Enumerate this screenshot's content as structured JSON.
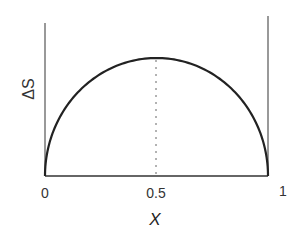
{
  "chart_data": {
    "type": "line",
    "title": "",
    "xlabel": "X",
    "ylabel": "ΔS",
    "xlim": [
      0,
      1
    ],
    "x_ticks": [
      "0",
      "0.5",
      "1"
    ],
    "y_ticks": [],
    "grid": false,
    "series": [
      {
        "name": "ΔS(X)",
        "shape": "semi-ellipse",
        "x": [
          0,
          0.05,
          0.1,
          0.2,
          0.3,
          0.4,
          0.5,
          0.6,
          0.7,
          0.8,
          0.9,
          0.95,
          1
        ],
        "values": [
          0,
          0.44,
          0.6,
          0.8,
          0.92,
          0.98,
          1.0,
          0.98,
          0.92,
          0.8,
          0.6,
          0.44,
          0
        ]
      }
    ],
    "annotations": [
      {
        "type": "dotted-vertical-line",
        "x": 0.5,
        "from": 0,
        "to": 1.0,
        "label": "maximum at X = 0.5"
      }
    ]
  },
  "labels": {
    "tick_0": "0",
    "tick_half": "0.5",
    "tick_1": "1",
    "xlabel": "X",
    "ylabel": "ΔS"
  },
  "colors": {
    "curve": "#222222",
    "axes": "#444444",
    "dotted": "#666666"
  }
}
